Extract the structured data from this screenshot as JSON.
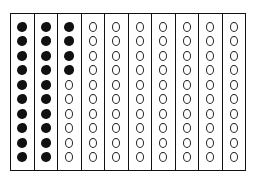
{
  "diagram": {
    "type": "hundreds-grid",
    "columns": 10,
    "units_per_column": 10,
    "total_units": 100,
    "filled_count": 24,
    "filled_per_column": [
      10,
      10,
      4,
      0,
      0,
      0,
      0,
      0,
      0,
      0
    ],
    "colors": {
      "filled": "#111111",
      "outline": "#111111",
      "background": "#ffffff"
    }
  }
}
